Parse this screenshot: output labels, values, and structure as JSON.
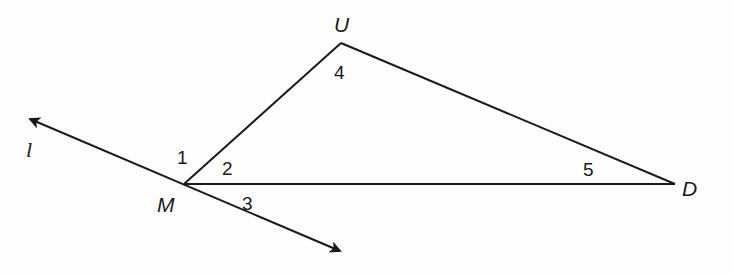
{
  "diagram": {
    "type": "geometry-triangle-with-line",
    "colors": {
      "stroke": "#1a1a1a",
      "background": "#fdfdfd"
    },
    "points": {
      "U": {
        "label": "U",
        "x": 341,
        "y": 43
      },
      "M": {
        "label": "M",
        "x": 184,
        "y": 184
      },
      "D": {
        "label": "D",
        "x": 675,
        "y": 184
      }
    },
    "line": {
      "label": "l",
      "start": {
        "x": 26,
        "y": 117
      },
      "end": {
        "x": 344,
        "y": 253
      },
      "passes_through": "M",
      "arrows": "both"
    },
    "segments": [
      "MU",
      "UD",
      "MD"
    ],
    "angles": [
      {
        "label": "1",
        "at": "M",
        "between": "line l (upper-left) and MU"
      },
      {
        "label": "2",
        "at": "M",
        "between": "MU and MD"
      },
      {
        "label": "3",
        "at": "M",
        "between": "MD and line l (lower-right)"
      },
      {
        "label": "4",
        "at": "U",
        "between": "UM and UD"
      },
      {
        "label": "5",
        "at": "D",
        "between": "DU and DM"
      }
    ]
  },
  "labels": {
    "U": "U",
    "M": "M",
    "D": "D",
    "l": "l",
    "a1": "1",
    "a2": "2",
    "a3": "3",
    "a4": "4",
    "a5": "5"
  }
}
